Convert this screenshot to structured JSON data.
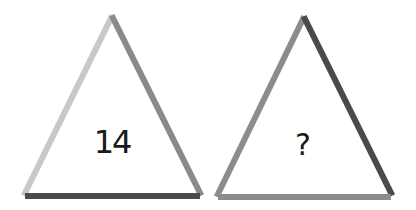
{
  "puzzle": {
    "triangles": [
      {
        "label": "14",
        "edges": {
          "left": "#c8c8c8",
          "right": "#8a8a8a",
          "base": "#4a4a4a"
        }
      },
      {
        "label": "?",
        "edges": {
          "left": "#8c8c8c",
          "right": "#4a4a4a",
          "base": "#8c8c8c"
        }
      }
    ]
  }
}
